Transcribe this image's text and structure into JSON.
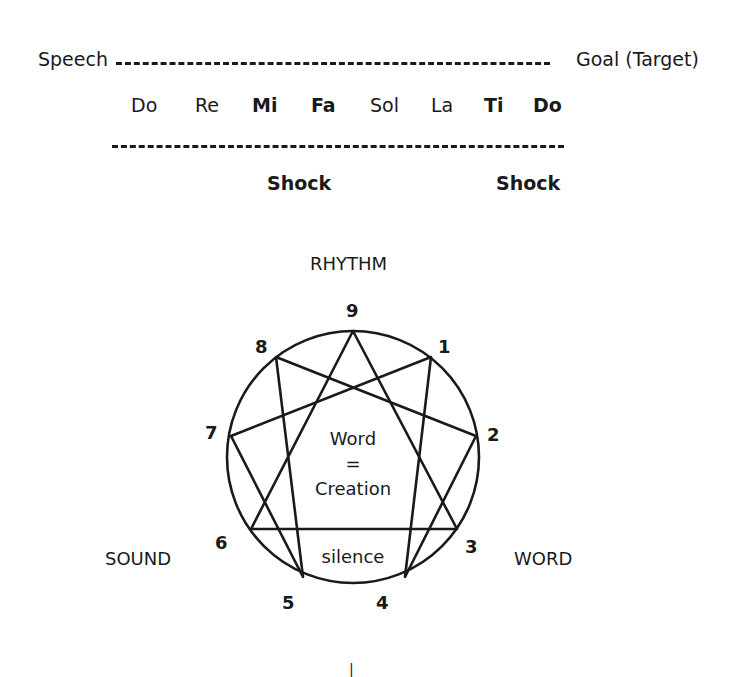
{
  "octave": {
    "start_label": "Speech",
    "end_label": "Goal (Target)",
    "notes": [
      {
        "label": "Do",
        "bold": false
      },
      {
        "label": "Re",
        "bold": false
      },
      {
        "label": "Mi",
        "bold": true
      },
      {
        "label": "Fa",
        "bold": true
      },
      {
        "label": "Sol",
        "bold": false
      },
      {
        "label": "La",
        "bold": false
      },
      {
        "label": "Ti",
        "bold": true
      },
      {
        "label": "Do",
        "bold": true
      }
    ],
    "shocks": [
      "Shock",
      "Shock"
    ]
  },
  "enneagram": {
    "top_label": "RHYTHM",
    "left_label": "SOUND",
    "right_label": "WORD",
    "center_line1": "Word",
    "center_line2": "=",
    "center_line3": "Creation",
    "inner_bottom_label": "silence",
    "points": [
      "9",
      "1",
      "2",
      "3",
      "4",
      "5",
      "6",
      "7",
      "8"
    ],
    "stroke_color": "#1a1a1a"
  },
  "bottom_mark": "|"
}
